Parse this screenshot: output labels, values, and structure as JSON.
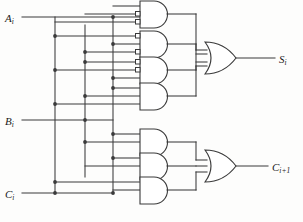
{
  "diagram": {
    "line_color": "#3a3a3a",
    "fill_color": "#ffffff",
    "text_color": "#1a1a1a"
  },
  "inputs": [
    {
      "id": "A",
      "label_main": "A",
      "label_sub": "i",
      "y": 17
    },
    {
      "id": "B",
      "label_main": "B",
      "label_sub": "i",
      "y": 120
    },
    {
      "id": "C",
      "label_main": "C",
      "label_sub": "i",
      "y": 193
    }
  ],
  "outputs": [
    {
      "id": "S",
      "label_main": "S",
      "label_sub": "i",
      "y": 58
    },
    {
      "id": "Cout",
      "label_main": "C",
      "label_sub": "i+1",
      "y": 166
    }
  ],
  "gates": {
    "sum_and": [
      {
        "name": "and-gate-1",
        "minterm": "A'·B'·C",
        "bubbles": [
          false,
          true,
          true
        ]
      },
      {
        "name": "and-gate-2",
        "minterm": "A'·B·C'",
        "bubbles": [
          true,
          false,
          true
        ]
      },
      {
        "name": "and-gate-3",
        "minterm": "A·B'·C'",
        "bubbles": [
          true,
          true,
          false
        ]
      },
      {
        "name": "and-gate-4",
        "minterm": "A·B·C",
        "bubbles": [
          false,
          false,
          false
        ]
      }
    ],
    "carry_and": [
      {
        "name": "and-gate-5",
        "minterm": "A·B",
        "bubbles": [
          false,
          false
        ]
      },
      {
        "name": "and-gate-6",
        "minterm": "A·C",
        "bubbles": [
          false,
          false
        ]
      },
      {
        "name": "and-gate-7",
        "minterm": "B·C",
        "bubbles": [
          false,
          false
        ]
      }
    ],
    "sum_or": {
      "name": "or-gate-sum",
      "inputs": 4
    },
    "carry_or": {
      "name": "or-gate-carry",
      "inputs": 3
    }
  },
  "buses": [
    {
      "id": "bus-A",
      "x": 55
    },
    {
      "id": "bus-B",
      "x": 85
    },
    {
      "id": "bus-C",
      "x": 113
    }
  ]
}
